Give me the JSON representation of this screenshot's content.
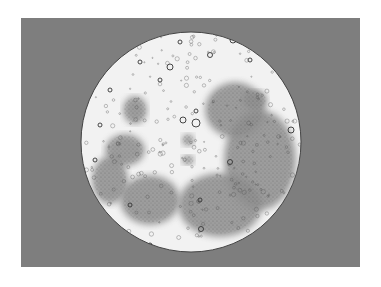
{
  "image": {
    "subject": "moon-illustration",
    "description": "Engraved-style drawing of the full Moon's near side with craters and maria",
    "background_color": "#ffffff",
    "frame_color": "#7e7e7e",
    "moon_highland_color": "#f2f2f2",
    "moon_maria_color": "#8f8f8f"
  },
  "moon": {
    "cx": 191,
    "cy": 142,
    "r": 110,
    "maria": [
      {
        "name": "mare-imbrium",
        "cx": 150,
        "cy": 200,
        "rx": 30,
        "ry": 25
      },
      {
        "name": "oceanus-procellarum",
        "cx": 110,
        "cy": 180,
        "rx": 18,
        "ry": 24
      },
      {
        "name": "mare-nubium-region",
        "cx": 220,
        "cy": 205,
        "rx": 42,
        "ry": 32
      },
      {
        "name": "eastern-maria",
        "cx": 260,
        "cy": 160,
        "rx": 36,
        "ry": 50
      },
      {
        "name": "mare-serenitatis-region",
        "cx": 235,
        "cy": 110,
        "rx": 30,
        "ry": 28
      },
      {
        "name": "western-mare",
        "cx": 125,
        "cy": 150,
        "rx": 20,
        "ry": 16
      },
      {
        "name": "small-mare-north",
        "cx": 135,
        "cy": 110,
        "rx": 12,
        "ry": 14
      },
      {
        "name": "mare-crisium-like",
        "cx": 255,
        "cy": 100,
        "rx": 12,
        "ry": 10
      },
      {
        "name": "central-dark-1",
        "cx": 188,
        "cy": 140,
        "rx": 6,
        "ry": 6
      },
      {
        "name": "central-dark-2",
        "cx": 188,
        "cy": 160,
        "rx": 6,
        "ry": 5
      }
    ],
    "craters": [
      {
        "cx": 196,
        "cy": 123,
        "r": 4
      },
      {
        "cx": 183,
        "cy": 120,
        "r": 3
      },
      {
        "cx": 196,
        "cy": 111,
        "r": 2
      },
      {
        "cx": 291,
        "cy": 130,
        "r": 3
      },
      {
        "cx": 201,
        "cy": 229,
        "r": 2.5
      },
      {
        "cx": 170,
        "cy": 67,
        "r": 3
      },
      {
        "cx": 140,
        "cy": 62,
        "r": 2
      },
      {
        "cx": 210,
        "cy": 55,
        "r": 2.5
      },
      {
        "cx": 233,
        "cy": 40,
        "r": 3
      },
      {
        "cx": 110,
        "cy": 90,
        "r": 2
      },
      {
        "cx": 100,
        "cy": 125,
        "r": 2
      },
      {
        "cx": 120,
        "cy": 230,
        "r": 2
      },
      {
        "cx": 150,
        "cy": 245,
        "r": 2
      },
      {
        "cx": 160,
        "cy": 80,
        "r": 2
      },
      {
        "cx": 230,
        "cy": 162,
        "r": 2.5
      },
      {
        "cx": 200,
        "cy": 200,
        "r": 2
      },
      {
        "cx": 250,
        "cy": 60,
        "r": 2
      },
      {
        "cx": 180,
        "cy": 42,
        "r": 2
      },
      {
        "cx": 95,
        "cy": 160,
        "r": 2
      },
      {
        "cx": 130,
        "cy": 205,
        "r": 2
      }
    ]
  }
}
